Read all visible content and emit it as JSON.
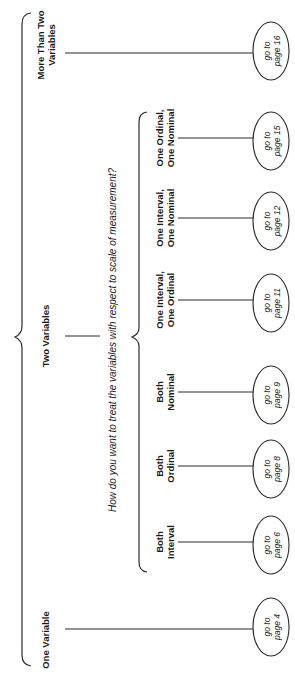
{
  "diagram": {
    "orientation": "rotated-90-ccw",
    "root_branches": [
      {
        "id": "more-than-two",
        "label_lines": [
          "More Than Two",
          "Variables"
        ],
        "target": [
          "go to",
          "page 16"
        ]
      },
      {
        "id": "two",
        "label_lines": [
          "Two Variables"
        ],
        "target": null
      },
      {
        "id": "one",
        "label_lines": [
          "One Variable"
        ],
        "target": [
          "go to",
          "page 4"
        ]
      }
    ],
    "question": "How do you want to treat the variables with respect to scale of measurement?",
    "sub_branches": [
      {
        "id": "ordinal-nominal",
        "label_lines": [
          "One Ordinal,",
          "One Nominal"
        ],
        "target": [
          "go to",
          "page 15"
        ]
      },
      {
        "id": "interval-nominal",
        "label_lines": [
          "One Interval,",
          "One Nominal"
        ],
        "target": [
          "go to",
          "page 12"
        ]
      },
      {
        "id": "interval-ordinal",
        "label_lines": [
          "One Interval,",
          "One Ordinal"
        ],
        "target": [
          "go to",
          "page 11"
        ]
      },
      {
        "id": "both-nominal",
        "label_lines": [
          "Both",
          "Nominal"
        ],
        "target": [
          "go to",
          "page 9"
        ]
      },
      {
        "id": "both-ordinal",
        "label_lines": [
          "Both",
          "Ordinal"
        ],
        "target": [
          "go to",
          "page 8"
        ]
      },
      {
        "id": "both-interval",
        "label_lines": [
          "Both",
          "Interval"
        ],
        "target": [
          "go to",
          "page 6"
        ]
      }
    ]
  }
}
